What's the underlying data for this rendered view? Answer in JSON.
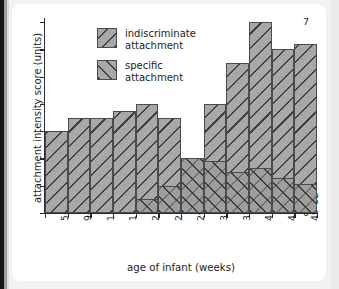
{
  "chart_data": {
    "type": "bar",
    "title": "",
    "xlabel": "age of infant (weeks)",
    "ylabel": "attachment intensity score (units)",
    "categories": [
      "5–8",
      "9–12",
      "13–16",
      "17–20",
      "21–24",
      "25–28",
      "29–32",
      "33–36",
      "37–40",
      "41–44",
      "45–48",
      "49–52"
    ],
    "ylim": [
      0,
      7
    ],
    "yticks": [
      0,
      1,
      2,
      3,
      4,
      5,
      6,
      7
    ],
    "grid": false,
    "legend_position": "upper-left-inside",
    "stacking": "overlaid",
    "series": [
      {
        "name": "indiscriminate attachment",
        "hatch": "backslash",
        "color": "#a8a8a8",
        "values": [
          3.0,
          3.5,
          3.5,
          3.75,
          4.0,
          3.5,
          2.0,
          4.0,
          5.5,
          7.0,
          6.0,
          6.2
        ]
      },
      {
        "name": "specific attachment",
        "hatch": "forwardslash",
        "color": "#9a9a9a",
        "values": [
          0,
          0,
          0,
          0,
          0.5,
          1.0,
          2.0,
          1.9,
          1.5,
          1.65,
          1.3,
          1.05
        ]
      }
    ]
  },
  "legend": {
    "items": [
      {
        "label": "indiscriminate\nattachment",
        "swatch": "backslash-hatch-swatch"
      },
      {
        "label": "specific\nattachment",
        "swatch": "forwardslash-hatch-swatch"
      }
    ]
  },
  "colors": {
    "page_background": "#f2f2f0",
    "card_background": "#ffffff",
    "axis": "#2b2b2b",
    "bar_fill": "#a8a8a8",
    "hatch": "#3c3c3c",
    "text": "#1d1d1d"
  }
}
